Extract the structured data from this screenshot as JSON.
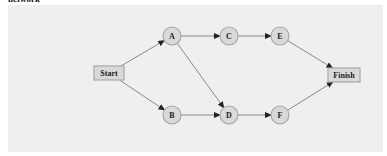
{
  "caption": "network",
  "diagram": {
    "type": "activity-network",
    "colors": {
      "background": "#efefef",
      "node_fill": "#d9d9d9",
      "node_stroke": "#a8a8a8",
      "edge": "#8a8a8a",
      "arrow": "#222222"
    },
    "nodes": [
      {
        "id": "Start",
        "label": "Start",
        "shape": "box",
        "x": 109,
        "y": 73
      },
      {
        "id": "A",
        "label": "A",
        "shape": "circle",
        "x": 172,
        "y": 36
      },
      {
        "id": "B",
        "label": "B",
        "shape": "circle",
        "x": 172,
        "y": 115
      },
      {
        "id": "C",
        "label": "C",
        "shape": "circle",
        "x": 229,
        "y": 36
      },
      {
        "id": "D",
        "label": "D",
        "shape": "circle",
        "x": 229,
        "y": 115
      },
      {
        "id": "E",
        "label": "E",
        "shape": "circle",
        "x": 280,
        "y": 36
      },
      {
        "id": "F",
        "label": "F",
        "shape": "circle",
        "x": 280,
        "y": 115
      },
      {
        "id": "Finish",
        "label": "Finish",
        "shape": "box",
        "x": 344,
        "y": 75
      }
    ],
    "edges": [
      {
        "from": "Start",
        "to": "A"
      },
      {
        "from": "Start",
        "to": "B"
      },
      {
        "from": "A",
        "to": "C"
      },
      {
        "from": "A",
        "to": "D"
      },
      {
        "from": "B",
        "to": "D"
      },
      {
        "from": "C",
        "to": "E"
      },
      {
        "from": "D",
        "to": "F"
      },
      {
        "from": "E",
        "to": "Finish"
      },
      {
        "from": "F",
        "to": "Finish"
      }
    ]
  }
}
